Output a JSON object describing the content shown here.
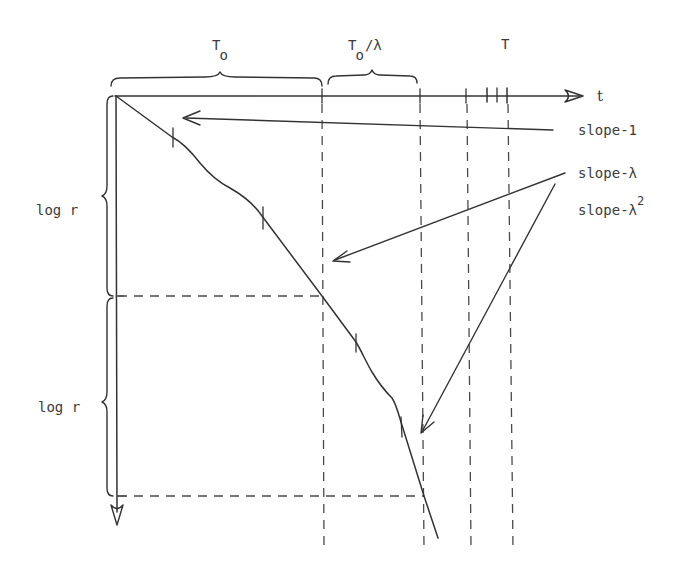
{
  "diagram": {
    "axes": {
      "horizontal_label": "t",
      "vertical_direction": "down (log r increasing downward)"
    },
    "top_braces": [
      {
        "label_main": "T",
        "label_sub": "o",
        "label_suffix": ""
      },
      {
        "label_main": "T",
        "label_sub": "o",
        "label_suffix": "/λ"
      }
    ],
    "top_right_label": "T",
    "left_braces": [
      {
        "label": "log r"
      },
      {
        "label": "log r"
      }
    ],
    "slope_labels": [
      {
        "text": "slope-1",
        "sup": ""
      },
      {
        "text": "slope-λ",
        "sup": ""
      },
      {
        "text": "slope-λ",
        "sup": "2"
      }
    ],
    "colors": {
      "ink": "#333333",
      "background": "#ffffff"
    }
  }
}
